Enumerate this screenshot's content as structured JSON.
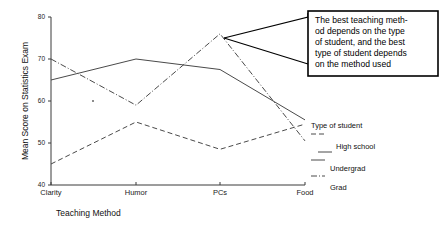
{
  "chart_data": {
    "type": "line",
    "title": "",
    "xlabel": "Teaching Method",
    "ylabel": "Mean Score on Statistics Exam",
    "categories": [
      "Clarity",
      "Humor",
      "PCs",
      "Food"
    ],
    "ylim": [
      40,
      80
    ],
    "yticks": [
      40,
      50,
      60,
      70,
      80
    ],
    "grid": false,
    "legend_position": "right",
    "legend_title": "Type of student",
    "series": [
      {
        "name": "High school",
        "style": "solid",
        "values": [
          65,
          70,
          67.5,
          55.5
        ]
      },
      {
        "name": "Undergrad",
        "style": "dashed",
        "values": [
          45,
          55,
          48.5,
          54.5
        ]
      },
      {
        "name": "Grad",
        "style": "dashdot",
        "values": [
          70,
          59,
          76,
          50.5
        ]
      }
    ],
    "annotations": [
      "The best teaching meth-od depends on the type of student, and the best type of student depends on the method used"
    ]
  },
  "axes": {
    "y_title": "Mean Score on Statistics Exam",
    "x_title": "Teaching Method",
    "y_tick_0": "40",
    "y_tick_1": "50",
    "y_tick_2": "60",
    "y_tick_3": "70",
    "y_tick_4": "80",
    "x_cat_0": "Clarity",
    "x_cat_1": "Humor",
    "x_cat_2": "PCs",
    "x_cat_3": "Food"
  },
  "legend": {
    "title": "Type of student",
    "items": [
      {
        "label": "High school",
        "style": "solid"
      },
      {
        "label": "Undergrad",
        "style": "dashed"
      },
      {
        "label": "Grad",
        "style": "dashdot"
      }
    ]
  },
  "callout": {
    "line1": "The best teaching meth-",
    "line2": "od depends on the type",
    "line3": "of student, and the best",
    "line4": "type of student depends",
    "line5": "on the method used"
  },
  "colors": {
    "ink": "#3a3a3a",
    "series": "#4a4a4a",
    "callout_border": "#000000",
    "background": "#ffffff"
  }
}
